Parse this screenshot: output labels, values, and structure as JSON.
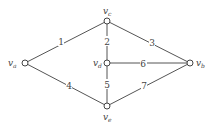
{
  "diagram": {
    "type": "weighted-graph",
    "vertices": [
      {
        "id": "a",
        "label": "v",
        "sub": "a",
        "x": 25,
        "y": 63
      },
      {
        "id": "c",
        "label": "v",
        "sub": "c",
        "x": 107,
        "y": 21
      },
      {
        "id": "d",
        "label": "v",
        "sub": "d",
        "x": 107,
        "y": 63
      },
      {
        "id": "b",
        "label": "v",
        "sub": "b",
        "x": 190,
        "y": 63
      },
      {
        "id": "e",
        "label": "v",
        "sub": "e",
        "x": 107,
        "y": 106
      }
    ],
    "edges": [
      {
        "from": "a",
        "to": "c",
        "weight": "1"
      },
      {
        "from": "c",
        "to": "d",
        "weight": "2"
      },
      {
        "from": "c",
        "to": "b",
        "weight": "3"
      },
      {
        "from": "a",
        "to": "e",
        "weight": "4"
      },
      {
        "from": "d",
        "to": "e",
        "weight": "5"
      },
      {
        "from": "d",
        "to": "b",
        "weight": "6"
      },
      {
        "from": "e",
        "to": "b",
        "weight": "7"
      }
    ]
  }
}
